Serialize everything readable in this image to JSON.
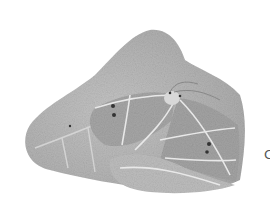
{
  "image": {
    "description": "Grayscale illustration of a moth resting on a leaf",
    "subject": "moth",
    "background": "leaf",
    "colors": {
      "background": "#ffffff",
      "leaf": "#b8b8b8",
      "leaf_light": "#d0d0d0",
      "wing": "#a9a9a9",
      "vein": "#e6e6e6",
      "spot": "#333333"
    }
  },
  "edge_text": "C"
}
